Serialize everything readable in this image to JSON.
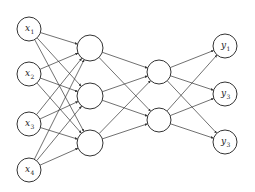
{
  "diagram": {
    "type": "feedforward-neural-network",
    "layers": [
      {
        "name": "input",
        "nodes": [
          {
            "id": "x1",
            "label": "x",
            "sub": "1",
            "x": 29,
            "y": 29
          },
          {
            "id": "x2",
            "label": "x",
            "sub": "2",
            "x": 29,
            "y": 74
          },
          {
            "id": "x3",
            "label": "x",
            "sub": "3",
            "x": 29,
            "y": 124
          },
          {
            "id": "x4",
            "label": "x",
            "sub": "4",
            "x": 29,
            "y": 170
          }
        ]
      },
      {
        "name": "hidden1",
        "nodes": [
          {
            "id": "h1",
            "label": "",
            "sub": "",
            "x": 90,
            "y": 48
          },
          {
            "id": "h2",
            "label": "",
            "sub": "",
            "x": 90,
            "y": 96
          },
          {
            "id": "h3",
            "label": "",
            "sub": "",
            "x": 90,
            "y": 143
          }
        ]
      },
      {
        "name": "hidden2",
        "nodes": [
          {
            "id": "g1",
            "label": "",
            "sub": "",
            "x": 159,
            "y": 72
          },
          {
            "id": "g2",
            "label": "",
            "sub": "",
            "x": 159,
            "y": 120
          }
        ]
      },
      {
        "name": "output",
        "nodes": [
          {
            "id": "y1",
            "label": "y",
            "sub": "1",
            "x": 225,
            "y": 46
          },
          {
            "id": "y2",
            "label": "y",
            "sub": "3",
            "x": 225,
            "y": 94
          },
          {
            "id": "y3",
            "label": "y",
            "sub": "3",
            "x": 225,
            "y": 142
          }
        ]
      }
    ],
    "connectivity": "fully-connected between adjacent layers",
    "colors": {
      "stroke": "#333333",
      "background": "#ffffff"
    }
  }
}
